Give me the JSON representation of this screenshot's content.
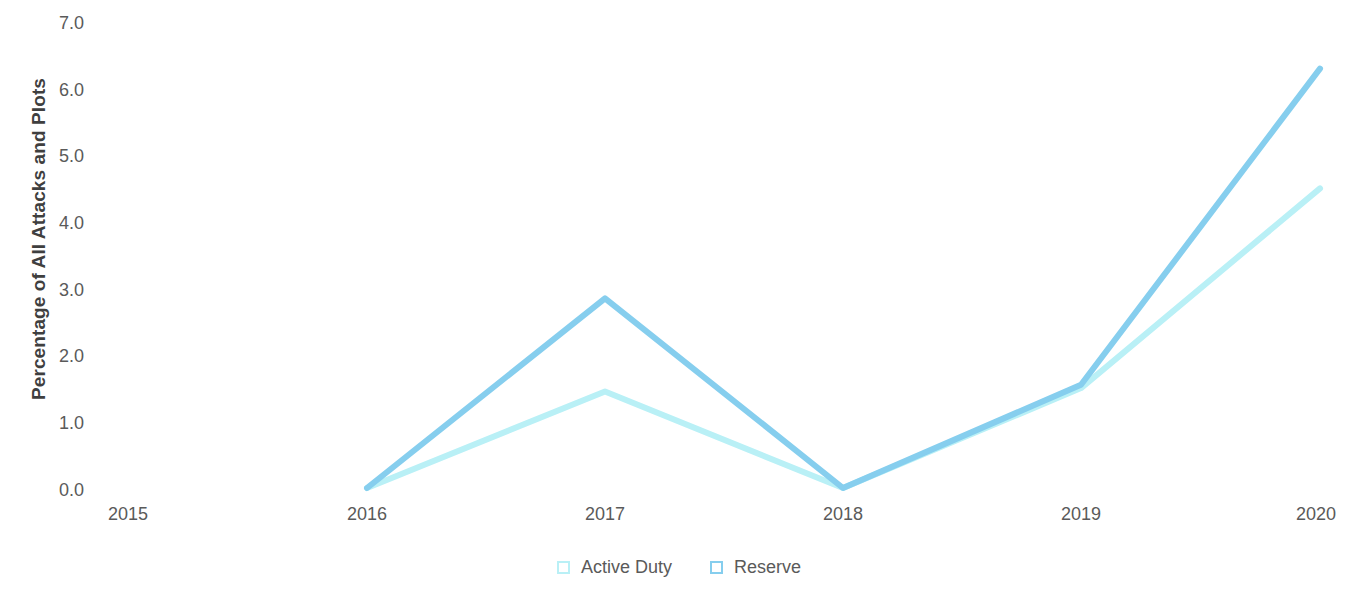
{
  "chart_data": {
    "type": "line",
    "title": "",
    "xlabel": "",
    "ylabel": "Percentage of All Attacks and Plots",
    "x": [
      "2015",
      "2016",
      "2017",
      "2018",
      "2019",
      "2020"
    ],
    "categories": [
      "2015",
      "2016",
      "2017",
      "2018",
      "2019",
      "2020"
    ],
    "xtick_labels": [
      "2015",
      "2016",
      "2017",
      "2018",
      "2019",
      "2020"
    ],
    "ytick_labels": [
      "7.0",
      "6.0",
      "5.0",
      "4.0",
      "3.0",
      "2.0",
      "1.0",
      "0.0"
    ],
    "ylim": [
      0.0,
      7.0
    ],
    "ytick_values": [
      7.0,
      6.0,
      5.0,
      4.0,
      3.0,
      2.0,
      1.0,
      0.0
    ],
    "grid": false,
    "legend_position": "bottom-center",
    "series": [
      {
        "name": "Active Duty",
        "color": "#b9f0f6",
        "values": [
          null,
          0.0,
          1.45,
          0.0,
          1.5,
          4.5
        ]
      },
      {
        "name": "Reserve",
        "color": "#86ceee",
        "values": [
          null,
          0.0,
          2.85,
          0.0,
          1.55,
          6.3
        ]
      }
    ]
  },
  "legend": {
    "items": [
      {
        "label": "Active Duty",
        "swatch": "legend-swatch-active-duty"
      },
      {
        "label": "Reserve",
        "swatch": "legend-swatch-reserve"
      }
    ]
  },
  "axes": {
    "y_title": "Percentage of All Attacks and Plots"
  }
}
